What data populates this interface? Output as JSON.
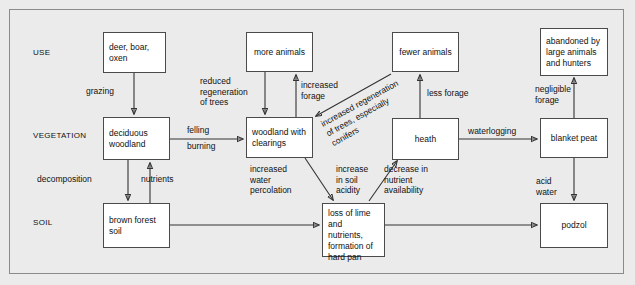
{
  "diagram": {
    "row_labels": [
      {
        "id": "use",
        "text": "USE"
      },
      {
        "id": "vegetation",
        "text": "VEGETATION"
      },
      {
        "id": "soil",
        "text": "SOIL"
      }
    ],
    "nodes": [
      {
        "id": "deer-boar-oxen",
        "text": "deer, boar,\noxen",
        "row": "use"
      },
      {
        "id": "more-animals",
        "text": "more animals",
        "row": "use"
      },
      {
        "id": "fewer-animals",
        "text": "fewer animals",
        "row": "use"
      },
      {
        "id": "abandoned",
        "text": "abandoned by\nlarge animals\nand hunters",
        "row": "use"
      },
      {
        "id": "deciduous-woodland",
        "text": "deciduous\nwoodland",
        "row": "vegetation"
      },
      {
        "id": "woodland-clearings",
        "text": "woodland with\nclearings",
        "row": "vegetation"
      },
      {
        "id": "heath",
        "text": "heath",
        "row": "vegetation"
      },
      {
        "id": "blanket-peat",
        "text": "blanket peat",
        "row": "vegetation"
      },
      {
        "id": "brown-forest-soil",
        "text": "brown forest\nsoil",
        "row": "soil"
      },
      {
        "id": "loss-of-lime",
        "text": "loss of lime\nand nutrients,\nformation of\nhard pan",
        "row": "soil"
      },
      {
        "id": "podzol",
        "text": "podzol",
        "row": "soil"
      }
    ],
    "edge_labels": [
      {
        "id": "grazing",
        "text": "grazing"
      },
      {
        "id": "reduced-regeneration",
        "text": "reduced\nregeneration\nof trees"
      },
      {
        "id": "increased-forage",
        "text": "increased\nforage"
      },
      {
        "id": "less-forage",
        "text": "less forage"
      },
      {
        "id": "negligible-forage",
        "text": "negligible\nforage"
      },
      {
        "id": "felling",
        "text": "felling"
      },
      {
        "id": "burning",
        "text": "burning"
      },
      {
        "id": "waterlogging",
        "text": "waterlogging"
      },
      {
        "id": "decomposition",
        "text": "decomposition"
      },
      {
        "id": "nutrients",
        "text": "nutrients"
      },
      {
        "id": "increased-water-percolation",
        "text": "increased\nwater\npercolation"
      },
      {
        "id": "increase-in-soil-acidity",
        "text": "increase\nin soil\nacidity"
      },
      {
        "id": "decrease-nutrient-availability",
        "text": "decrease in\nnutrient\navailability"
      },
      {
        "id": "acid-water",
        "text": "acid\nwater"
      },
      {
        "id": "increased-regeneration",
        "text": "increased regeneration\nof trees, especially\nconifers"
      }
    ],
    "colors": {
      "background": "#ebebeb",
      "node_fill": "#ffffff",
      "node_stroke": "#4a4a4a",
      "line": "#333333",
      "text": "#111111"
    }
  }
}
